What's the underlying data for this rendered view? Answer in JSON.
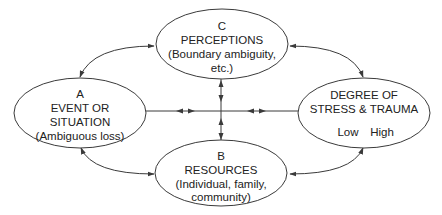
{
  "colors": {
    "stroke": "#3a3a3a",
    "text": "#222222",
    "background": "#ffffff"
  },
  "nodes": {
    "c": {
      "letter": "C",
      "title": "PERCEPTIONS",
      "line3": "(Boundary ambiguity,",
      "line4": "etc.)"
    },
    "a": {
      "letter": "A",
      "title": "EVENT OR",
      "line3": "SITUATION",
      "line4": "(Ambiguous loss)"
    },
    "d": {
      "title": "DEGREE OF",
      "line2": "STRESS & TRAUMA",
      "scale_low": "Low",
      "scale_high": "High"
    },
    "b": {
      "letter": "B",
      "title": "RESOURCES",
      "line3": "(Individual, family,",
      "line4": "community)"
    }
  },
  "edges": [
    {
      "from": "A",
      "to": "C",
      "type": "bidirectional-curved"
    },
    {
      "from": "C",
      "to": "D",
      "type": "bidirectional-curved"
    },
    {
      "from": "A",
      "to": "B",
      "type": "bidirectional-curved"
    },
    {
      "from": "B",
      "to": "D",
      "type": "bidirectional-curved"
    },
    {
      "from": "A",
      "to": "D",
      "type": "bidirectional-straight-horizontal"
    },
    {
      "from": "C",
      "to": "B",
      "type": "bidirectional-straight-vertical"
    }
  ]
}
